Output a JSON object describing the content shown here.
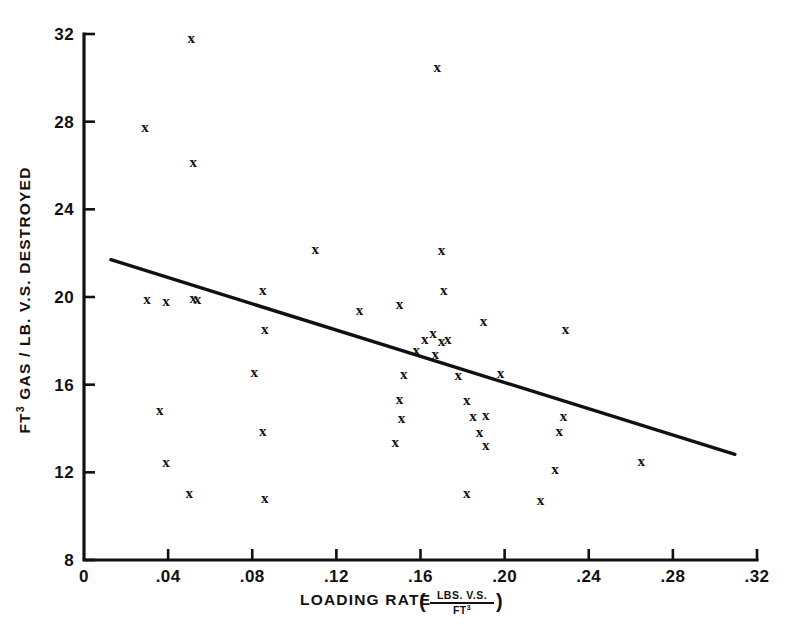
{
  "chart_data": {
    "type": "scatter",
    "title": "",
    "xlabel": "LOADING RATE",
    "xlabel_units_numerator": "LBS. V.S.",
    "xlabel_units_denominator": "FT",
    "xlabel_units_denominator_sup": "3",
    "ylabel_prefix": "FT",
    "ylabel_sup": "3",
    "ylabel_rest": " GAS / LB. V.S. DESTROYED",
    "xlim": [
      0,
      0.32
    ],
    "ylim": [
      8,
      32
    ],
    "xticks": [
      0,
      0.04,
      0.08,
      0.12,
      0.16,
      0.2,
      0.24,
      0.28,
      0.32
    ],
    "xticklabels": [
      "0",
      ".04",
      ".08",
      ".12",
      ".16",
      ".20",
      ".24",
      ".28",
      ".32"
    ],
    "yticks": [
      8,
      12,
      16,
      20,
      24,
      28,
      32
    ],
    "yticklabels": [
      "8",
      "12",
      "16",
      "20",
      "24",
      "28",
      "32"
    ],
    "grid": false,
    "legend": "none",
    "marker": "x",
    "marker_color": "#111111",
    "line_color": "#111111",
    "trendline": {
      "label": "least-squares fit line",
      "x_start": 0.0128,
      "y_start": 21.7,
      "x_end": 0.3095,
      "y_end": 12.82
    },
    "points": [
      {
        "x": 0.029,
        "y": 27.75
      },
      {
        "x": 0.051,
        "y": 31.8
      },
      {
        "x": 0.052,
        "y": 26.15
      },
      {
        "x": 0.11,
        "y": 22.2
      },
      {
        "x": 0.168,
        "y": 30.5
      },
      {
        "x": 0.17,
        "y": 22.15
      },
      {
        "x": 0.171,
        "y": 20.3
      },
      {
        "x": 0.03,
        "y": 19.9
      },
      {
        "x": 0.039,
        "y": 19.8
      },
      {
        "x": 0.052,
        "y": 19.95
      },
      {
        "x": 0.054,
        "y": 19.9
      },
      {
        "x": 0.085,
        "y": 20.3
      },
      {
        "x": 0.131,
        "y": 19.4
      },
      {
        "x": 0.15,
        "y": 19.7
      },
      {
        "x": 0.086,
        "y": 18.55
      },
      {
        "x": 0.19,
        "y": 18.9
      },
      {
        "x": 0.229,
        "y": 18.55
      },
      {
        "x": 0.162,
        "y": 18.1
      },
      {
        "x": 0.166,
        "y": 18.35
      },
      {
        "x": 0.17,
        "y": 18.0
      },
      {
        "x": 0.173,
        "y": 18.1
      },
      {
        "x": 0.158,
        "y": 17.6
      },
      {
        "x": 0.167,
        "y": 17.4
      },
      {
        "x": 0.081,
        "y": 16.6
      },
      {
        "x": 0.152,
        "y": 16.5
      },
      {
        "x": 0.178,
        "y": 16.45
      },
      {
        "x": 0.198,
        "y": 16.55
      },
      {
        "x": 0.15,
        "y": 15.35
      },
      {
        "x": 0.182,
        "y": 15.3
      },
      {
        "x": 0.036,
        "y": 14.85
      },
      {
        "x": 0.151,
        "y": 14.5
      },
      {
        "x": 0.185,
        "y": 14.55
      },
      {
        "x": 0.191,
        "y": 14.6
      },
      {
        "x": 0.228,
        "y": 14.55
      },
      {
        "x": 0.188,
        "y": 13.85
      },
      {
        "x": 0.085,
        "y": 13.9
      },
      {
        "x": 0.226,
        "y": 13.9
      },
      {
        "x": 0.148,
        "y": 13.4
      },
      {
        "x": 0.191,
        "y": 13.25
      },
      {
        "x": 0.039,
        "y": 12.45
      },
      {
        "x": 0.224,
        "y": 12.15
      },
      {
        "x": 0.265,
        "y": 12.5
      },
      {
        "x": 0.05,
        "y": 11.05
      },
      {
        "x": 0.086,
        "y": 10.85
      },
      {
        "x": 0.182,
        "y": 11.05
      },
      {
        "x": 0.217,
        "y": 10.75
      }
    ]
  }
}
